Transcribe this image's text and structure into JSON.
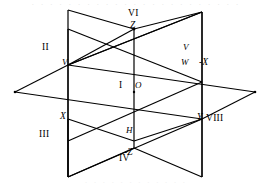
{
  "figure": {
    "kind": "three-perpendicular-planes-octant-diagram",
    "line_color": "#000000",
    "background_color": "#ffffff",
    "width": 272,
    "height": 188
  },
  "top_artifact": {
    "text": "· · · · · · · · · · · · · · · · · · · · · · ·"
  },
  "bottom_artifact": {
    "text": "· · · · · · · · · · · ·"
  },
  "octants": [
    {
      "id": "I",
      "label": "I",
      "x": 119,
      "y": 86
    },
    {
      "id": "II",
      "label": "II",
      "x": 42,
      "y": 48
    },
    {
      "id": "III",
      "label": "III",
      "x": 41,
      "y": 135
    },
    {
      "id": "IV",
      "label": "IV",
      "x": 121,
      "y": 159
    },
    {
      "id": "VI",
      "label": "VI",
      "x": 131,
      "y": 14
    },
    {
      "id": "VIII",
      "label": "VIII",
      "x": 208,
      "y": 119
    }
  ],
  "axes": [
    {
      "id": "Z",
      "label": "Z",
      "x": 131,
      "y": 26
    },
    {
      "id": "neg-Z",
      "label": "-Z",
      "x": 127,
      "y": 154
    },
    {
      "id": "X",
      "label": "X",
      "x": 63,
      "y": 117
    },
    {
      "id": "neg-X",
      "label": "-X",
      "x": 202,
      "y": 63
    },
    {
      "id": "Y",
      "label": "Y",
      "x": 195,
      "y": 117
    }
  ],
  "points": [
    {
      "id": "O",
      "label": "O",
      "x": 136,
      "y": 86
    },
    {
      "id": "V",
      "label": "V",
      "x": 64,
      "y": 62
    },
    {
      "id": "V-right",
      "label": "V",
      "x": 183,
      "y": 47
    },
    {
      "id": "W",
      "label": "W",
      "x": 183,
      "y": 63
    },
    {
      "id": "H",
      "label": "H",
      "x": 128,
      "y": 131
    }
  ],
  "geometry": {
    "origin": {
      "x": 134,
      "y": 92
    },
    "horizontal_plane": {
      "note": "rhombus: left vertex, top-back vertex, right vertex, bottom-front vertex",
      "points": "15,92 68,65 255,92 202,119"
    },
    "left_vertical_plane": {
      "note": "parallelogram standing vertically, left of origin",
      "points": "68,65 134,29 134,148 68,177"
    },
    "right_vertical_plane": {
      "note": "parallelogram standing vertically, right of origin",
      "points": "134,29 202,12 202,119 134,148"
    },
    "front_vertical_plane": {
      "note": "rhombus containing the vertical axis, front face",
      "points": "68,65 202,12 202,119 68,177"
    }
  }
}
